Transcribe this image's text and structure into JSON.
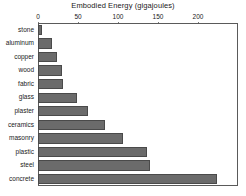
{
  "chart_data": {
    "type": "bar",
    "orientation": "horizontal",
    "title": "Embodied Energy (gigajoules)",
    "xlabel": "",
    "ylabel": "",
    "xlim": [
      0,
      250
    ],
    "xticks": [
      0,
      50,
      100,
      150,
      200
    ],
    "xtick_labels": [
      "0",
      "50",
      "100",
      "150",
      "200"
    ],
    "grid": false,
    "legend": null,
    "bar_color": "#6b6b6b",
    "bar_edge_color": "#4a4a4a",
    "axis_color": "#5a5a5a",
    "background": "#ffffff",
    "categories": [
      "stone",
      "aluminum",
      "copper",
      "wood",
      "fabric",
      "glass",
      "plaster",
      "ceramics",
      "masonry",
      "plastic",
      "steel",
      "concrete"
    ],
    "values": [
      5,
      18,
      24,
      30,
      31,
      49,
      62,
      84,
      106,
      136,
      140,
      224
    ]
  }
}
